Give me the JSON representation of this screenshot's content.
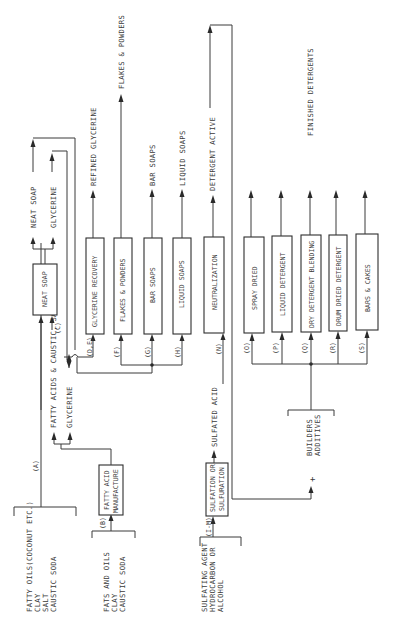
{
  "diagram": {
    "title": "FINISHED DETERGENTS",
    "orientation": "rotated -90deg (text reads bottom-to-top)",
    "inputs": {
      "fatty_oils": [
        "FATTY OILS(COCONUT ETC.)",
        "CLAY",
        "SALT",
        "CAUSTIC SODA"
      ],
      "fats_and_oils": [
        "FATS AND OILS",
        "CLAY",
        "CAUSTIC SODA"
      ],
      "sulfating": [
        "SULFATING AGENT",
        "HYDROCARBON OR",
        "ALCOHOL"
      ],
      "builders": [
        "BUILDERS",
        "ADDITIVES"
      ],
      "plus_sign": "+"
    },
    "stream_labels": {
      "A": "(A)",
      "B": "(B)",
      "C": "(C)",
      "DE": "(D,E)",
      "F": "(F)",
      "G": "(G)",
      "H": "(H)",
      "IM": "(I-M)",
      "N": "(N)",
      "O": "(O)",
      "P": "(P)",
      "Q": "(Q)",
      "R": "(R)",
      "S": "(S)"
    },
    "processes": {
      "fatty_acid_manufacture": [
        "FATTY ACID",
        "MANUFACTURE"
      ],
      "neat_soap": "NEAT SOAP",
      "glycerine_recovery": "GLYCERINE RECOVERY",
      "flakes_powders": "FLAKES & POWDERS",
      "bar_soaps": "BAR SOAPS",
      "liquid_soaps": "LIQUID SOAPS",
      "sulfation": [
        "SULFATION OR",
        "SULFURATION"
      ],
      "neutralization": "NEUTRALIZATION",
      "spray_dried": "SPRAY DRIED",
      "liquid_detergent": "LIQUID DETERGENT",
      "dry_detergent_blending": "DRY DETERGENT BLENDING",
      "drum_dried_detergent": "DRUM DRIED DETERGENT",
      "bars_cakes": "BARS & CAKES"
    },
    "intermediates": {
      "fatty_acids_caustic_salt": "FATTY ACIDS & CAUSTIC, SALT",
      "glycerine_from_fam": "GLYCERINE",
      "neat_soap_out": "NEAT SOAP",
      "glycerine_out": "GLYCERINE",
      "sulfated_acid": "SULFATED ACID"
    },
    "outputs": {
      "refined_glycerine": "REFINED GLYCERINE",
      "flakes_powders": "FLAKES & POWDERS",
      "bar_soaps": "BAR SOAPS",
      "liquid_soaps": "LIQUID SOAPS",
      "detergent_active": "DETERGENT ACTIVE"
    }
  }
}
